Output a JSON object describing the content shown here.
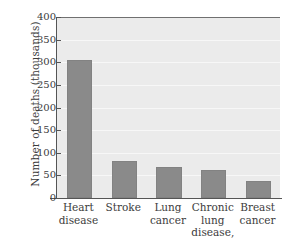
{
  "chart_data": {
    "type": "bar",
    "title": "",
    "xlabel": "",
    "ylabel": "Number of deaths (thousands)",
    "categories": [
      "Heart disease",
      "Stroke",
      "Lung cancer",
      "Chronic lung disease, noncancerous",
      "Breast cancer"
    ],
    "category_lines": [
      [
        "Heart",
        "disease"
      ],
      [
        "Stroke"
      ],
      [
        "Lung",
        "cancer"
      ],
      [
        "Chronic lung",
        "disease,",
        "noncancerous"
      ],
      [
        "Breast",
        "cancer"
      ]
    ],
    "values": [
      305,
      82,
      69,
      63,
      38
    ],
    "ylim": [
      0,
      400
    ],
    "yticks": [
      0,
      50,
      100,
      150,
      200,
      250,
      300,
      350,
      400
    ],
    "ytick_labels": [
      "0",
      "50",
      "100",
      "150",
      "200",
      "250",
      "300",
      "350",
      "400"
    ],
    "grid": true,
    "legend": false
  },
  "style": {
    "bar_color": "#8a8a8a",
    "plot_background": "#ebebeb",
    "page_background": "#ffffff",
    "gridline_color": "#f7f7f7",
    "axis_color": "#555555",
    "text_color": "#3c3c3c"
  }
}
